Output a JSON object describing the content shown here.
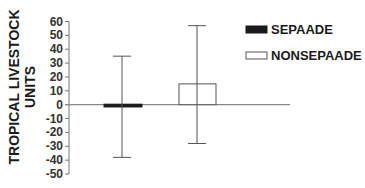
{
  "chart_data": {
    "type": "bar",
    "title": "",
    "xlabel": "",
    "ylabel": "TROPICAL LIVESTOCK UNITS",
    "ylabel_lines": [
      "TROPICAL LIVESTOCK",
      "UNITS"
    ],
    "ylim": [
      -50,
      60
    ],
    "yticks": [
      60,
      50,
      40,
      30,
      20,
      10,
      0,
      -10,
      -20,
      -30,
      -40,
      -50
    ],
    "grid": false,
    "legend_position": "upper right",
    "categories": [
      "SEPAADE",
      "NONSEPAADE"
    ],
    "series": [
      {
        "name": "SEPAADE",
        "value": -2,
        "error_low": -38,
        "error_high": 35,
        "fill": "#1a1a1a"
      },
      {
        "name": "NONSEPAADE",
        "value": 15,
        "error_low": -28,
        "error_high": 57,
        "fill": "#ffffff"
      }
    ],
    "legend": [
      {
        "label": "SEPAADE",
        "swatch": "#1a1a1a"
      },
      {
        "label": "NONSEPAADE",
        "swatch": "#ffffff"
      }
    ]
  }
}
